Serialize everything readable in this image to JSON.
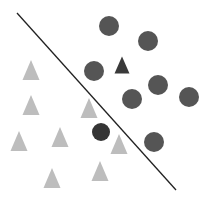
{
  "diagram": {
    "type": "linear-classifier-decision-boundary",
    "width": 212,
    "height": 199,
    "background": "#ffffff",
    "boundary": {
      "x1": 17,
      "y1": 13,
      "x2": 176,
      "y2": 190,
      "color": "#222222",
      "stroke_width": 1.3
    },
    "colors": {
      "circle_class": "#555555",
      "circle_misclassified": "#353535",
      "triangle_class": "#bdbdbd",
      "triangle_misclassified": "#3a3a3a"
    },
    "circles": [
      {
        "cx": 109,
        "cy": 26,
        "r": 10,
        "kind": "circle_class"
      },
      {
        "cx": 148,
        "cy": 41,
        "r": 10,
        "kind": "circle_class"
      },
      {
        "cx": 94,
        "cy": 71,
        "r": 10,
        "kind": "circle_class"
      },
      {
        "cx": 158,
        "cy": 85,
        "r": 10,
        "kind": "circle_class"
      },
      {
        "cx": 132,
        "cy": 99,
        "r": 10,
        "kind": "circle_class"
      },
      {
        "cx": 189,
        "cy": 97,
        "r": 10,
        "kind": "circle_class"
      },
      {
        "cx": 154,
        "cy": 142,
        "r": 10,
        "kind": "circle_class"
      },
      {
        "cx": 101,
        "cy": 132,
        "r": 9,
        "kind": "circle_misclassified"
      }
    ],
    "triangles": [
      {
        "cx": 122,
        "cy": 65,
        "w": 15,
        "h": 17,
        "kind": "triangle_misclassified"
      },
      {
        "cx": 31,
        "cy": 70,
        "w": 17,
        "h": 20,
        "kind": "triangle_class"
      },
      {
        "cx": 31,
        "cy": 105,
        "w": 17,
        "h": 20,
        "kind": "triangle_class"
      },
      {
        "cx": 89,
        "cy": 108,
        "w": 17,
        "h": 20,
        "kind": "triangle_class"
      },
      {
        "cx": 19,
        "cy": 141,
        "w": 17,
        "h": 20,
        "kind": "triangle_class"
      },
      {
        "cx": 60,
        "cy": 137,
        "w": 17,
        "h": 20,
        "kind": "triangle_class"
      },
      {
        "cx": 119,
        "cy": 144,
        "w": 17,
        "h": 20,
        "kind": "triangle_class"
      },
      {
        "cx": 52,
        "cy": 178,
        "w": 17,
        "h": 20,
        "kind": "triangle_class"
      },
      {
        "cx": 100,
        "cy": 171,
        "w": 17,
        "h": 20,
        "kind": "triangle_class"
      }
    ]
  }
}
